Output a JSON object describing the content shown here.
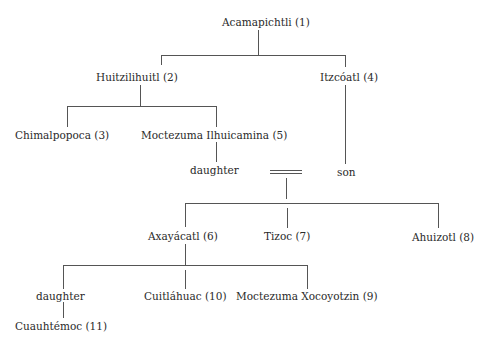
{
  "diagram": {
    "type": "genealogy-tree",
    "line_color": "#555555",
    "text_color": "#2a2a2a",
    "nodes": {
      "acamapichtli": "Acamapichtli (1)",
      "huitzilihuitl": "Huitzilihuitl (2)",
      "itzcoatl": "Itzcóatl (4)",
      "chimalpopoca": "Chimalpopoca (3)",
      "moctezuma_ilhuicamina": "Moctezuma Ilhuicamina (5)",
      "daughter_1": "daughter",
      "son": "son",
      "axayacatl": "Axayácatl (6)",
      "tizoc": "Tizoc (7)",
      "ahuizotl": "Ahuizotl (8)",
      "daughter_2": "daughter",
      "cuitlahuac": "Cuitláhuac (10)",
      "moctezuma_xocoyotzin": "Moctezuma Xocoyotzin (9)",
      "cuauhtemoc": "Cuauhtémoc (11)"
    },
    "relations": [
      {
        "parent": "Acamapichtli (1)",
        "children": [
          "Huitzilihuitl (2)",
          "Itzcóatl (4)"
        ]
      },
      {
        "parent": "Huitzilihuitl (2)",
        "children": [
          "Chimalpopoca (3)",
          "Moctezuma Ilhuicamina (5)"
        ]
      },
      {
        "parent": "Moctezuma Ilhuicamina (5)",
        "children": [
          "daughter"
        ]
      },
      {
        "parent": "Itzcóatl (4)",
        "children": [
          "son"
        ]
      },
      {
        "marriage": [
          "daughter",
          "son"
        ],
        "children": [
          "Axayácatl (6)",
          "Tizoc (7)",
          "Ahuizotl (8)"
        ]
      },
      {
        "parent": "Axayácatl (6)",
        "children": [
          "daughter",
          "Cuitláhuac (10)",
          "Moctezuma Xocoyotzin (9)"
        ]
      },
      {
        "parent": "daughter",
        "children": [
          "Cuauhtémoc (11)"
        ]
      }
    ]
  }
}
